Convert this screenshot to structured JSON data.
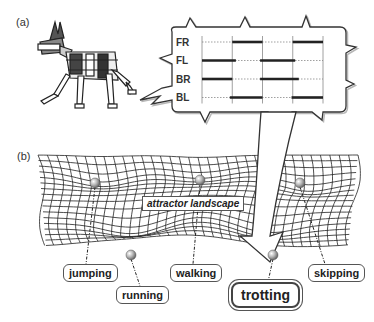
{
  "panels": {
    "a_label": "(a)",
    "b_label": "(b)"
  },
  "gait_diagram": {
    "legs": [
      {
        "name": "FR",
        "stance": [
          [
            0.25,
            0.5
          ],
          [
            0.75,
            1.0
          ]
        ]
      },
      {
        "name": "FL",
        "stance": [
          [
            0.0,
            0.28
          ],
          [
            0.48,
            0.77
          ]
        ]
      },
      {
        "name": "BR",
        "stance": [
          [
            0.0,
            0.25
          ],
          [
            0.48,
            0.8
          ]
        ]
      },
      {
        "name": "BL",
        "stance": [
          [
            0.23,
            0.5
          ],
          [
            0.74,
            1.0
          ]
        ]
      }
    ],
    "cycle_dividers": [
      0.25,
      0.5,
      0.75
    ]
  },
  "landscape": {
    "label": "attractor landscape",
    "states": [
      {
        "id": "jumping",
        "label": "jumping"
      },
      {
        "id": "running",
        "label": "running"
      },
      {
        "id": "walking",
        "label": "walking"
      },
      {
        "id": "trotting",
        "label": "trotting",
        "highlighted": true
      },
      {
        "id": "skipping",
        "label": "skipping"
      }
    ]
  },
  "colors": {
    "line": "#222222",
    "ball": "#9a9a9a",
    "shadow": "#bbbbbb"
  }
}
